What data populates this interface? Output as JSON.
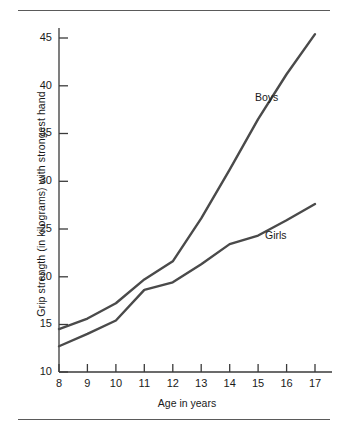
{
  "chart_data": {
    "type": "line",
    "title": "",
    "xlabel": "Age in years",
    "ylabel": "Grip strength (in kilograms) with strongest hand",
    "x": [
      8,
      9,
      10,
      11,
      12,
      13,
      14,
      15,
      16,
      17
    ],
    "xticklabels": [
      "8",
      "9",
      "10",
      "11",
      "12",
      "13",
      "14",
      "15",
      "16",
      "17"
    ],
    "yticks": [
      10,
      15,
      20,
      25,
      30,
      35,
      40,
      45
    ],
    "yticklabels": [
      "10",
      "15",
      "20",
      "25",
      "30",
      "35",
      "40",
      "45"
    ],
    "xlim": [
      8,
      17
    ],
    "ylim": [
      10,
      46.2
    ],
    "grid": false,
    "legend_position": "inline-annotations",
    "series": [
      {
        "name": "Boys",
        "values": [
          14.5,
          15.6,
          17.2,
          19.7,
          21.6,
          26.1,
          31.2,
          36.5,
          41.2,
          45.4
        ],
        "color": "#4a4a4a",
        "annotation": "Boys"
      },
      {
        "name": "Girls",
        "values": [
          12.7,
          14.0,
          15.4,
          18.6,
          19.4,
          21.3,
          23.4,
          24.3,
          25.9,
          27.6
        ],
        "color": "#4a4a4a",
        "annotation": "Girls"
      }
    ],
    "annotations": [
      {
        "text": "Boys",
        "x": 15.0,
        "y": 39.5
      },
      {
        "text": "Girls",
        "x": 15.4,
        "y": 25.1
      }
    ]
  },
  "axis": {
    "y_title": "Grip strength (in kilograms) with strongest hand",
    "x_title": "Age in years",
    "y_tick_labels": [
      "45",
      "40",
      "35",
      "30",
      "25",
      "20",
      "15",
      "10"
    ],
    "x_tick_labels": [
      "8",
      "9",
      "10",
      "11",
      "12",
      "13",
      "14",
      "15",
      "16",
      "17"
    ]
  },
  "labels": {
    "boys": "Boys",
    "girls": "Girls"
  },
  "colors": {
    "line": "#4a4a4a",
    "axis": "#3a3a3a",
    "rule": "#5a5a5a",
    "text": "#1a1a1a"
  }
}
